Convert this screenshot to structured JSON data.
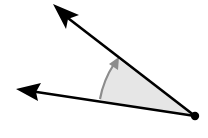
{
  "diagram": {
    "type": "angle",
    "vertex": {
      "x": 195,
      "y": 116
    },
    "rays": [
      {
        "name": "upper-ray",
        "tip": {
          "x": 53,
          "y": 4
        }
      },
      {
        "name": "lower-ray",
        "tip": {
          "x": 16,
          "y": 89
        }
      }
    ],
    "rotation_arrow": {
      "direction": "counterclockwise",
      "from": "lower-ray",
      "to": "upper-ray"
    },
    "colors": {
      "ray": "#000000",
      "fill": "#e6e6e6",
      "arc": "#8c8c8c",
      "background": "#ffffff"
    }
  }
}
